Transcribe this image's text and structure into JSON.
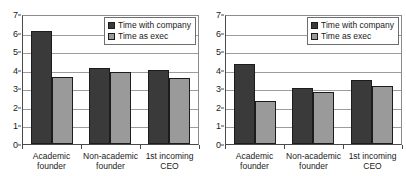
{
  "chart_data": [
    {
      "panel": "left",
      "type": "bar",
      "title": "",
      "xlabel": "",
      "ylabel": "",
      "ylim": [
        0,
        7
      ],
      "yticks": [
        0,
        1,
        2,
        3,
        4,
        5,
        6,
        7
      ],
      "grid": true,
      "legend_position": "top-right",
      "categories": [
        "Academic founder",
        "Non-academic founder",
        "1st incoming CEO"
      ],
      "category_lines": [
        [
          "Academic",
          "founder"
        ],
        [
          "Non-academic",
          "founder"
        ],
        [
          "1st incoming",
          "CEO"
        ]
      ],
      "series": [
        {
          "name": "Time with company",
          "color": "#3a3a3a",
          "values": [
            6.1,
            4.1,
            4.0
          ]
        },
        {
          "name": "Time as exec",
          "color": "#9a9a9a",
          "values": [
            3.6,
            3.9,
            3.55
          ]
        }
      ]
    },
    {
      "panel": "right",
      "type": "bar",
      "title": "",
      "xlabel": "",
      "ylabel": "",
      "ylim": [
        0,
        7
      ],
      "yticks": [
        0,
        1,
        2,
        3,
        4,
        5,
        6,
        7
      ],
      "grid": true,
      "legend_position": "top-right",
      "categories": [
        "Academic founder",
        "Non-academic founder",
        "1st incoming CEO"
      ],
      "category_lines": [
        [
          "Academic",
          "founder"
        ],
        [
          "Non-academic",
          "founder"
        ],
        [
          "1st incoming",
          "CEO"
        ]
      ],
      "series": [
        {
          "name": "Time with company",
          "color": "#3a3a3a",
          "values": [
            4.3,
            3.0,
            3.45
          ]
        },
        {
          "name": "Time as exec",
          "color": "#9a9a9a",
          "values": [
            2.3,
            2.8,
            3.1
          ]
        }
      ]
    }
  ],
  "style": {
    "background": "#ffffff",
    "gridline_color": "#9c9c9c",
    "axis_color": "#4a4a4a",
    "text_color": "#1a1a1a",
    "series_colors": [
      "#3a3a3a",
      "#9a9a9a"
    ]
  }
}
